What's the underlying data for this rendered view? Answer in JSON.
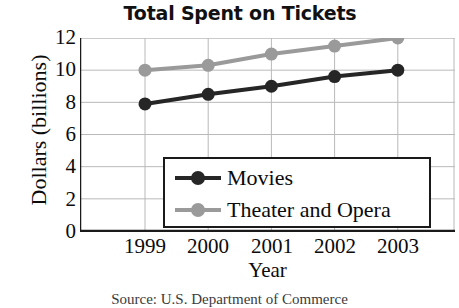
{
  "chart_data": {
    "type": "line",
    "title": "Total Spent on Tickets",
    "xlabel": "Year",
    "ylabel": "Dollars (billions)",
    "categories": [
      "1999",
      "2000",
      "2001",
      "2002",
      "2003"
    ],
    "series": [
      {
        "name": "Movies",
        "color": "#262626",
        "values": [
          7.9,
          8.5,
          9.0,
          9.6,
          10.0
        ]
      },
      {
        "name": "Theater and Opera",
        "color": "#9a9a9a",
        "values": [
          10.0,
          10.3,
          11.0,
          11.5,
          12.0
        ]
      }
    ],
    "ylim": [
      0,
      12
    ],
    "yticks": [
      "12",
      "10",
      "8",
      "6",
      "4",
      "2",
      "0"
    ],
    "ytick_values": [
      12,
      10,
      8,
      6,
      4,
      2,
      0
    ],
    "grid": true,
    "legend_position": "lower-center",
    "marker": "circle"
  },
  "source_note": "Source: U.S. Department of Commerce",
  "colors": {
    "movies": "#262626",
    "theater": "#9a9a9a",
    "axis": "#1a1a1a",
    "grid": "#b9b9b9",
    "background": "#ffffff"
  }
}
